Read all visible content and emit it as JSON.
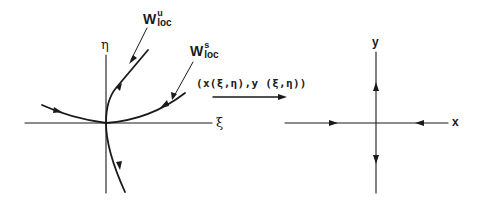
{
  "left_figure": {
    "horizontal_axis_label": "ξ",
    "vertical_axis_label": "η",
    "unstable_manifold_label": {
      "base": "W",
      "sup": "u",
      "sub": "loc"
    },
    "stable_manifold_label": {
      "base": "W",
      "sup": "s",
      "sub": "loc"
    }
  },
  "mapping": {
    "label": "(x(ξ,η),y (ξ,η))"
  },
  "right_figure": {
    "horizontal_axis_label": "x",
    "vertical_axis_label": "y"
  },
  "colors": {
    "ink": "#1a1a1a",
    "background": "#ffffff"
  }
}
